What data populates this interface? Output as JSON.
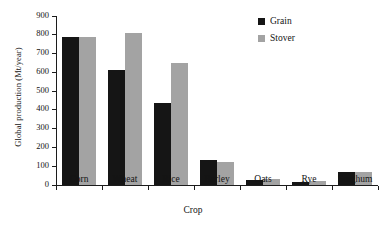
{
  "chart_data": {
    "type": "bar",
    "title": "",
    "xlabel": "Crop",
    "ylabel": "Global production (Mt/year)",
    "categories": [
      "Corn",
      "Wheat",
      "Rice",
      "Barley",
      "Oats",
      "Rye",
      "Sorghum"
    ],
    "series": [
      {
        "name": "Grain",
        "color": "#151515",
        "values": [
          790,
          610,
          435,
          135,
          26,
          15,
          70
        ]
      },
      {
        "name": "Stover",
        "color": "#a3a3a3",
        "values": [
          790,
          810,
          650,
          122,
          34,
          22,
          70
        ]
      }
    ],
    "ylim": [
      0,
      900
    ],
    "ytick_labels": [
      "900",
      "800",
      "700",
      "600",
      "500",
      "400",
      "300",
      "200",
      "100",
      "0"
    ],
    "ytick_values": [
      900,
      800,
      700,
      600,
      500,
      400,
      300,
      200,
      100,
      0
    ],
    "grid": false,
    "legend_position": "top-right"
  },
  "legend": {
    "entries": [
      {
        "label": "Grain",
        "swatch": "#151515"
      },
      {
        "label": "Stover",
        "swatch": "#a3a3a3"
      }
    ]
  }
}
